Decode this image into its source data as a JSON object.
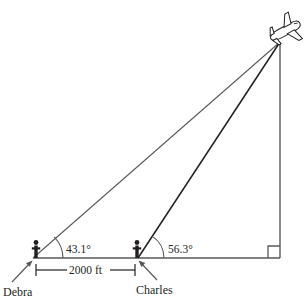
{
  "diagram": {
    "type": "geometry-trig-diagram",
    "background_color": "#ffffff",
    "line_color": "#58595b",
    "dark_line_color": "#231f20",
    "labels": {
      "angle_debra": "43.1°",
      "angle_charles": "56.3°",
      "distance": "2000 ft",
      "observer_left": "Debra",
      "observer_right": "Charles"
    },
    "icons": {
      "airplane": "airplane-icon",
      "person_left": "person-icon",
      "person_right": "person-icon",
      "right_angle": "right-angle-mark-icon",
      "arrow_left": "leader-arrow-icon",
      "arrow_right": "leader-arrow-icon"
    },
    "geometry": {
      "baseline_y": 258,
      "debra_x": 33,
      "charles_x": 138,
      "base_right_x": 280,
      "apex_x": 280,
      "apex_y": 42,
      "dimension_line_y": 270,
      "angle_arc_debra_radius": 30,
      "angle_arc_charles_radius": 26
    }
  }
}
